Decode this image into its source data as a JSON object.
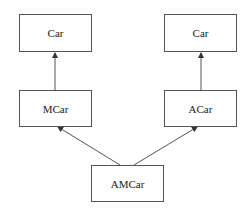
{
  "diagram": {
    "type": "class-inheritance",
    "nodes": [
      {
        "id": "car_left",
        "label": "Car"
      },
      {
        "id": "car_right",
        "label": "Car"
      },
      {
        "id": "mcar",
        "label": "MCar"
      },
      {
        "id": "acar",
        "label": "ACar"
      },
      {
        "id": "amcar",
        "label": "AMCar"
      }
    ],
    "edges": [
      {
        "from": "mcar",
        "to": "car_left"
      },
      {
        "from": "acar",
        "to": "car_right"
      },
      {
        "from": "amcar",
        "to": "mcar"
      },
      {
        "from": "amcar",
        "to": "acar"
      }
    ],
    "colors": {
      "line": "#555555",
      "text": "#222222",
      "background": "#ffffff"
    }
  }
}
